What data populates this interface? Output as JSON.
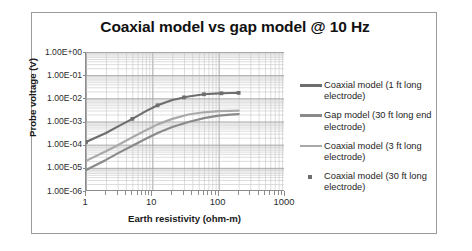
{
  "chart_data": {
    "type": "line",
    "title": "Coaxial model vs gap model @ 10 Hz",
    "xlabel": "Earth resistivity (ohm-m)",
    "ylabel": "Probe voltage (V)",
    "xscale": "log",
    "yscale": "log",
    "xlim": [
      1,
      1000
    ],
    "ylim": [
      1e-06,
      1
    ],
    "grid": true,
    "legend_position": "right",
    "xticks": [
      "1",
      "10",
      "100",
      "1000"
    ],
    "xtick_values": [
      1,
      10,
      100,
      1000
    ],
    "yticks": [
      "1.00E+00",
      "1.00E-01",
      "1.00E-02",
      "1.00E-03",
      "1.00E-04",
      "1.00E-05",
      "1.00E-06"
    ],
    "ytick_values": [
      1,
      0.1,
      0.01,
      0.001,
      0.0001,
      1e-05,
      1e-06
    ],
    "series": [
      {
        "name": "Coaxial model (1 ft long electrode)",
        "color": "#6e6e6e",
        "style": "line",
        "x": [
          1,
          2,
          3,
          5,
          8,
          12,
          20,
          35,
          60,
          100,
          150,
          200
        ],
        "y": [
          0.00013,
          0.00032,
          0.0006,
          0.0013,
          0.0028,
          0.005,
          0.0085,
          0.012,
          0.015,
          0.0165,
          0.017,
          0.0172
        ]
      },
      {
        "name": "Gap model (30 ft long end electrode)",
        "color": "#8a8a8a",
        "style": "line",
        "x": [
          1,
          2,
          3,
          5,
          8,
          12,
          20,
          35,
          60,
          100,
          150,
          200
        ],
        "y": [
          8e-06,
          2.2e-05,
          4.2e-05,
          9e-05,
          0.00018,
          0.00032,
          0.00058,
          0.00095,
          0.0014,
          0.0018,
          0.002,
          0.0021
        ]
      },
      {
        "name": "Coaxial model (3 ft long electrode)",
        "color": "#a9a9a9",
        "style": "line",
        "x": [
          1,
          2,
          3,
          5,
          8,
          12,
          20,
          35,
          60,
          100,
          150,
          200
        ],
        "y": [
          2e-05,
          5.2e-05,
          9.5e-05,
          0.00021,
          0.00042,
          0.00075,
          0.0013,
          0.002,
          0.0025,
          0.0028,
          0.0029,
          0.00295
        ]
      },
      {
        "name": "Coaxial model (30 ft long electrode)",
        "color": "#6e6e6e",
        "style": "marker",
        "marker": "square",
        "x": [
          1,
          5,
          12,
          30,
          60,
          110,
          200
        ],
        "y": [
          0.00013,
          0.0013,
          0.005,
          0.011,
          0.015,
          0.0165,
          0.0172
        ]
      }
    ],
    "legend": [
      {
        "label": "Coaxial model (1 ft long electrode)",
        "swatch": "line",
        "color": "#6e6e6e"
      },
      {
        "label": "Gap model (30 ft long end electrode)",
        "swatch": "line",
        "color": "#8a8a8a"
      },
      {
        "label": "Coaxial model (3 ft long electrode)",
        "swatch": "line",
        "color": "#a9a9a9"
      },
      {
        "label": "Coaxial model (30 ft long electrode)",
        "swatch": "marker",
        "color": "#6e6e6e"
      }
    ]
  },
  "colors": {
    "frame": "#9a9a9a",
    "axis": "#8c8c8c",
    "grid_major": "#9d9d9d",
    "grid_minor": "#c6c6c6",
    "text": "#1a1a1a",
    "background": "#ffffff"
  }
}
